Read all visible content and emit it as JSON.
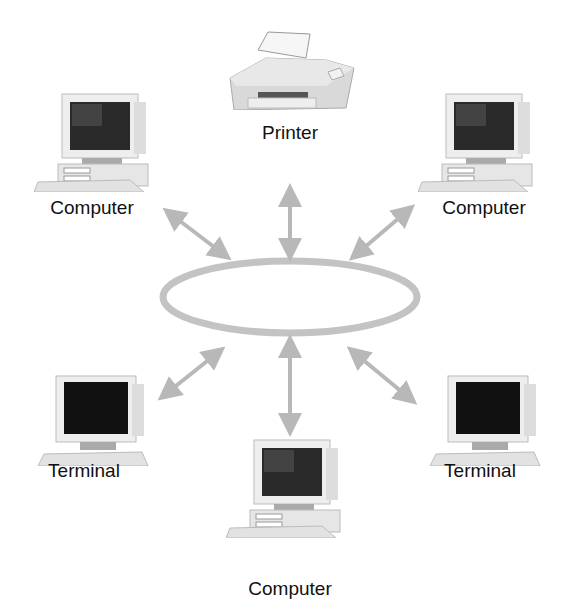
{
  "diagram": {
    "type": "ring-network",
    "colors": {
      "ring": "#c3c3c3",
      "arrow": "#b8b8b8",
      "screen": "#1a1a1a",
      "case": "#ececec",
      "label": "#111111"
    },
    "nodes": [
      {
        "id": "printer",
        "label": "Printer",
        "kind": "printer"
      },
      {
        "id": "computer-top-left",
        "label": "Computer",
        "kind": "computer"
      },
      {
        "id": "computer-top-right",
        "label": "Computer",
        "kind": "computer"
      },
      {
        "id": "terminal-bottom-left",
        "label": "Terminal",
        "kind": "terminal"
      },
      {
        "id": "computer-bottom",
        "label": "Computer",
        "kind": "computer"
      },
      {
        "id": "terminal-bottom-right",
        "label": "Terminal",
        "kind": "terminal"
      }
    ],
    "center": {
      "shape": "ellipse",
      "label": ""
    }
  }
}
